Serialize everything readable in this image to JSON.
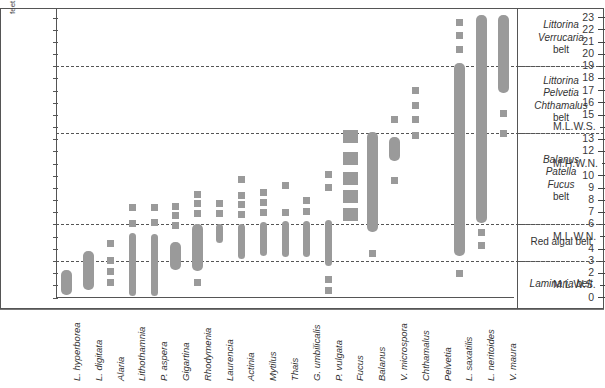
{
  "axis": {
    "y_unit_label": "feet",
    "y_ticks": [
      "23",
      "22",
      "21",
      "20",
      "19",
      "18",
      "17",
      "16",
      "15",
      "M.L.W.S.",
      "13",
      "12",
      "M.H.W.N.",
      "10",
      "9",
      "8",
      "7",
      "6",
      "M.L.W.N.",
      "4",
      "3",
      "2",
      "M.L.W.S.",
      "0"
    ]
  },
  "zones": [
    {
      "lines": [
        "Littorina",
        "Verrucaria",
        "belt"
      ],
      "italic": [
        true,
        true,
        false
      ]
    },
    {
      "lines": [
        "Littorina",
        "Pelvetia",
        "Chthamalus",
        "belt"
      ],
      "italic": [
        true,
        true,
        true,
        false
      ]
    },
    {
      "lines": [
        "Balanus",
        "Patella",
        "Fucus",
        "belt"
      ],
      "italic": [
        true,
        true,
        true,
        false
      ]
    },
    {
      "lines": [
        "Red algal belt"
      ],
      "italic": [
        false
      ]
    },
    {
      "lines": [
        "Laminaria belt"
      ],
      "italic": [
        true
      ]
    }
  ],
  "chart_data": {
    "type": "bar",
    "title": "",
    "xlabel": "",
    "ylabel": "feet",
    "ylim": [
      0,
      23
    ],
    "grid": true,
    "legend": "none",
    "datum_lines": [
      {
        "label": "M.L.W.S.",
        "value": 19.0
      },
      {
        "label": "M.H.W.N.",
        "value": 13.5
      },
      {
        "label": "M.L.W.N.",
        "value": 6.0
      },
      {
        "label": "M.L.W.S.",
        "value": 3.0
      }
    ],
    "categories": [
      "L. hyperborea",
      "L. digitata",
      "Alaria",
      "Lithothamnia",
      "P. aspera",
      "Gigartina",
      "Rhodymenia",
      "Laurencia",
      "Actinia",
      "Mytilus",
      "Thais",
      "G. umbilicalis",
      "P. vulgata",
      "Fucus",
      "Balanus",
      "V. microspora",
      "Chthamalus",
      "Pelvetia",
      "L. saxatilis",
      "L. neritoides",
      "V. maura"
    ],
    "series": [
      {
        "name": "L. hyperborea",
        "range": [
          0.2,
          2.3
        ],
        "marks": []
      },
      {
        "name": "L. digitata",
        "range": [
          0.6,
          3.8
        ],
        "marks": []
      },
      {
        "name": "Alaria",
        "range": [],
        "marks": [
          1.2,
          2.1,
          3.0,
          4.4
        ]
      },
      {
        "name": "Lithothamnia",
        "range": [
          0.1,
          5.3
        ],
        "marks": [
          6.1,
          7.4
        ]
      },
      {
        "name": "P. aspera",
        "range": [
          0.1,
          5.2
        ],
        "marks": [
          6.2,
          7.4
        ]
      },
      {
        "name": "Gigartina",
        "range": [
          2.3,
          4.6
        ],
        "marks": [
          5.9,
          6.7,
          7.5
        ]
      },
      {
        "name": "Rhodymenia",
        "range": [
          2.2,
          6.0
        ],
        "marks": [
          1.2,
          6.9,
          7.7,
          8.5
        ]
      },
      {
        "name": "Laurencia",
        "range": [
          4.5,
          6.0
        ],
        "marks": [
          6.9,
          7.7
        ]
      },
      {
        "name": "Actinia",
        "range": [
          3.2,
          6.0
        ],
        "marks": [
          6.8,
          7.6,
          8.4,
          9.7
        ]
      },
      {
        "name": "Mytilus",
        "range": [
          3.4,
          6.2
        ],
        "marks": [
          7.0,
          7.8,
          8.6
        ]
      },
      {
        "name": "Thais",
        "range": [
          3.3,
          6.3
        ],
        "marks": [
          7.0,
          9.2
        ]
      },
      {
        "name": "G. umbilicalis",
        "range": [
          3.3,
          6.3
        ],
        "marks": [
          7.1,
          8.0
        ]
      },
      {
        "name": "P. vulgata",
        "range": [
          2.6,
          6.4
        ],
        "marks": [
          1.5,
          0.6,
          9.0,
          10.1
        ]
      },
      {
        "name": "Fucus",
        "range": [],
        "marks": [
          6.8,
          8.3,
          9.8,
          11.4,
          13.2
        ]
      },
      {
        "name": "Balanus",
        "range": [
          5.4,
          13.6
        ],
        "marks": [
          3.6
        ]
      },
      {
        "name": "V. microspora",
        "range": [
          11.2,
          13.2
        ],
        "marks": [
          9.6,
          14.6
        ]
      },
      {
        "name": "Chthamalus",
        "range": [],
        "marks": [
          13.3,
          14.6,
          15.8,
          17.0
        ]
      },
      {
        "name": "Pelvetia",
        "range": [],
        "marks": []
      },
      {
        "name": "L. saxalllis",
        "range": [
          3.4,
          19.3
        ],
        "marks": [
          2.0,
          20.4,
          21.5,
          22.6
        ]
      },
      {
        "name": "L. neritoides",
        "range": [
          6.1,
          23.2
        ],
        "marks": [
          4.3,
          5.3
        ]
      },
      {
        "name": "V. maura",
        "range": [
          16.8,
          23.2
        ],
        "marks": [
          13.5,
          15.1
        ]
      }
    ]
  },
  "colors": {
    "bar": "#9a9a9a",
    "axis": "#555555",
    "text": "#333333",
    "background": "#ffffff"
  }
}
